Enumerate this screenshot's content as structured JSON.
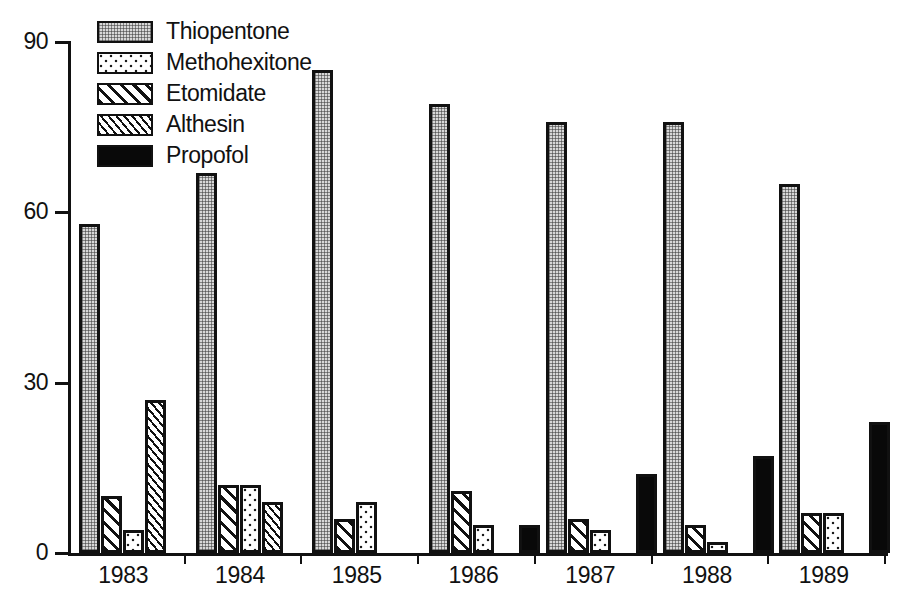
{
  "chart": {
    "type": "bar",
    "title": "",
    "xlabel": "",
    "ylabel": "",
    "background": "#ffffff",
    "foreground": "#111111"
  },
  "chart_data": {
    "type": "bar",
    "title": "",
    "subtitle": "",
    "xlabel": "",
    "ylabel": "",
    "categories": [
      "1983",
      "1984",
      "1985",
      "1986",
      "1987",
      "1988",
      "1989"
    ],
    "ylim": [
      0,
      90
    ],
    "yticks": [
      0,
      30,
      60,
      90
    ],
    "grid": false,
    "legend_position": "top-left",
    "bar_order_note": "within each year bars are drawn left-to-right as: Thiopentone, Etomidate, Methohexitone, Althesin, Propofol",
    "series": [
      {
        "name": "Thiopentone",
        "pattern": "fine-checker-grey",
        "color": "#d8d8d8",
        "values": [
          58,
          67,
          85,
          79,
          76,
          76,
          65
        ]
      },
      {
        "name": "Methohexitone",
        "pattern": "coarse-dots",
        "color": "#ffffff",
        "values": [
          4,
          12,
          9,
          5,
          4,
          2,
          7
        ]
      },
      {
        "name": "Etomidate",
        "pattern": "wide-diagonal-hatch",
        "color": "#ffffff",
        "values": [
          10,
          12,
          6,
          11,
          6,
          5,
          7
        ]
      },
      {
        "name": "Althesin",
        "pattern": "fine-diagonal-hatch",
        "color": "#ffffff",
        "values": [
          27,
          9,
          0,
          0,
          0,
          0,
          0
        ]
      },
      {
        "name": "Propofol",
        "pattern": "solid-black",
        "color": "#090909",
        "values": [
          0,
          0,
          0,
          5,
          14,
          17,
          23
        ]
      }
    ]
  },
  "legend": {
    "items": [
      {
        "label": "Thiopentone",
        "swatch": "legend-swatch-thiopentone"
      },
      {
        "label": "Methohexitone",
        "swatch": "legend-swatch-methohexitone"
      },
      {
        "label": "Etomidate",
        "swatch": "legend-swatch-etomidate"
      },
      {
        "label": "Althesin",
        "swatch": "legend-swatch-althesin"
      },
      {
        "label": "Propofol",
        "swatch": "legend-swatch-propofol"
      }
    ]
  },
  "yaxis": {
    "ticks": [
      "90",
      "60",
      "30",
      "0"
    ]
  },
  "xaxis": {
    "ticks": [
      "1983",
      "1984",
      "1985",
      "1986",
      "1987",
      "1988",
      "1989"
    ]
  }
}
